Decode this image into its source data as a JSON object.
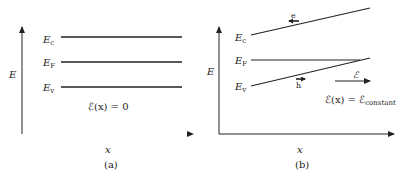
{
  "panels": [
    {
      "id": "a",
      "caption": "(a)",
      "y_axis_label": "E",
      "x_axis_label": "x",
      "levels": [
        {
          "symbol": "E",
          "subscript": "c"
        },
        {
          "symbol": "E",
          "subscript": "F"
        },
        {
          "symbol": "E",
          "subscript": "v"
        }
      ],
      "field_equation": "ℰ(x) = 0"
    },
    {
      "id": "b",
      "caption": "(b)",
      "y_axis_label": "E",
      "x_axis_label": "x",
      "levels": [
        {
          "symbol": "E",
          "subscript": "c"
        },
        {
          "symbol": "E",
          "subscript": "F"
        },
        {
          "symbol": "E",
          "subscript": "v"
        }
      ],
      "electron_label": "e",
      "hole_label": "h",
      "field_arrow_label": "ℰ",
      "field_equation_main": "ℰ(x) = ℰ",
      "field_equation_sub": "constant"
    }
  ],
  "colors": {
    "line": "#222222",
    "background": "#ffffff"
  }
}
